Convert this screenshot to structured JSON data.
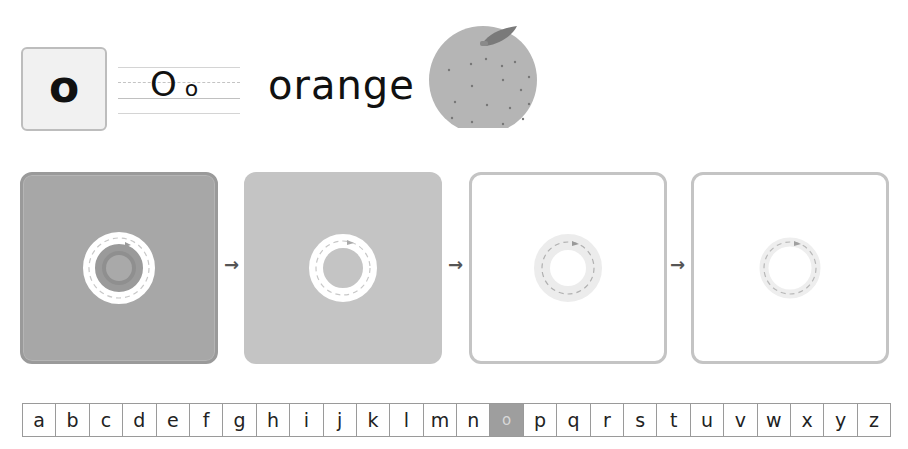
{
  "header": {
    "letter_card": "o",
    "guide_upper": "O",
    "guide_lower": "o",
    "word": "orange",
    "picture": "orange-fruit-icon"
  },
  "colors": {
    "panel_dark": "#a7a7a7",
    "panel_mid": "#c4c4c4",
    "panel_border": "#c4c4c4",
    "active_cell": "#9e9e9e",
    "fruit": "#b5b5b5",
    "leaf": "#7a7a7a"
  },
  "tracing": {
    "steps": [
      {
        "label": "step-1-shaded-tracing",
        "arrow": ""
      },
      {
        "label": "step-2-solid-tracing",
        "arrow": "→"
      },
      {
        "label": "step-3-light-tracing",
        "arrow": "→"
      },
      {
        "label": "step-4-faint-tracing",
        "arrow": "→"
      }
    ]
  },
  "alphabet": {
    "letters": [
      "a",
      "b",
      "c",
      "d",
      "e",
      "f",
      "g",
      "h",
      "i",
      "j",
      "k",
      "l",
      "m",
      "n",
      "o",
      "p",
      "q",
      "r",
      "s",
      "t",
      "u",
      "v",
      "w",
      "x",
      "y",
      "z"
    ],
    "active_index": 14
  }
}
